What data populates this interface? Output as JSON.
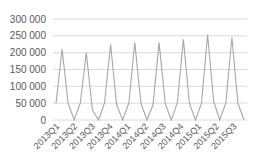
{
  "chart_data": {
    "type": "line",
    "title": "",
    "xlabel": "",
    "ylabel": "",
    "ylim": [
      0,
      300000
    ],
    "yticks": [
      0,
      50000,
      100000,
      150000,
      200000,
      250000,
      300000
    ],
    "ytick_labels": [
      "0",
      "50 000",
      "100 000",
      "150 000",
      "200 000",
      "250 000",
      "300 000"
    ],
    "xtick_labels": [
      "2013Q1",
      "2013Q2",
      "2013Q3",
      "2013Q4",
      "2014Q1",
      "2014Q2",
      "2014Q3",
      "2014Q4",
      "2015Q1",
      "2015Q2",
      "2015Q3"
    ],
    "grid": true,
    "legend": false,
    "series": [
      {
        "name": "Series 1",
        "color": "#a6a6a6",
        "values": [
          50000,
          210000,
          50000,
          0,
          50000,
          200000,
          30000,
          0,
          50000,
          225000,
          45000,
          0,
          50000,
          230000,
          50000,
          0,
          45000,
          230000,
          50000,
          0,
          50000,
          240000,
          50000,
          0,
          50000,
          253000,
          55000,
          0,
          50000,
          245000,
          50000,
          0
        ]
      }
    ]
  }
}
